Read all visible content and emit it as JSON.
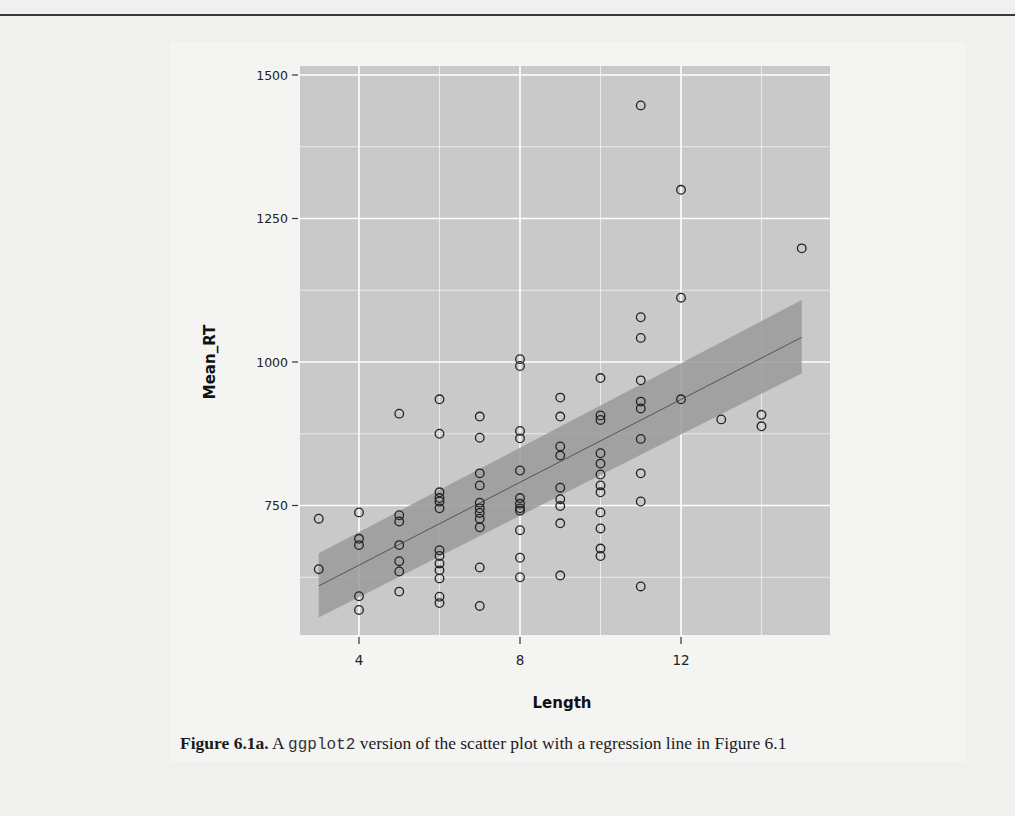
{
  "page": {
    "background": "#f0f0ef"
  },
  "caption": {
    "label": "Figure 6.1a.",
    "pre": " A ",
    "code": "ggplot2",
    "post": " version of the scatter plot with a regression line in Figure 6.1"
  },
  "chart_data": {
    "type": "scatter",
    "title": "",
    "xlabel": "Length",
    "ylabel": "Mean_RT",
    "xlim": [
      2.5,
      15.7
    ],
    "ylim": [
      570,
      1520
    ],
    "x_ticks": [
      4,
      8,
      12
    ],
    "y_ticks": [
      750,
      1000,
      1250,
      1500
    ],
    "x_minor_gridlines": [
      6,
      10,
      14
    ],
    "y_minor_gridlines": [
      625,
      875,
      1125,
      1375
    ],
    "grid": true,
    "legend": "none",
    "panel_color": "#c9c9c9",
    "grid_color": "#ffffff",
    "point_style": "open-circle",
    "regression": {
      "method": "lm",
      "x_range": [
        3,
        15
      ],
      "fit_y": [
        610,
        1043
      ],
      "ci_lower": [
        555,
        980
      ],
      "ci_upper": [
        667,
        1108
      ],
      "band_color": "#9a9a9a",
      "line_color": "#555555"
    },
    "points": [
      [
        3,
        727
      ],
      [
        3,
        639
      ],
      [
        4,
        738
      ],
      [
        4,
        692
      ],
      [
        4,
        681
      ],
      [
        4,
        592
      ],
      [
        4,
        568
      ],
      [
        5,
        910
      ],
      [
        5,
        733
      ],
      [
        5,
        722
      ],
      [
        5,
        681
      ],
      [
        5,
        653
      ],
      [
        5,
        635
      ],
      [
        5,
        600
      ],
      [
        6,
        935
      ],
      [
        6,
        875
      ],
      [
        6,
        773
      ],
      [
        6,
        763
      ],
      [
        6,
        757
      ],
      [
        6,
        745
      ],
      [
        6,
        672
      ],
      [
        6,
        662
      ],
      [
        6,
        649
      ],
      [
        6,
        637
      ],
      [
        6,
        623
      ],
      [
        6,
        591
      ],
      [
        6,
        580
      ],
      [
        7,
        905
      ],
      [
        7,
        868
      ],
      [
        7,
        806
      ],
      [
        7,
        785
      ],
      [
        7,
        755
      ],
      [
        7,
        745
      ],
      [
        7,
        737
      ],
      [
        7,
        727
      ],
      [
        7,
        712
      ],
      [
        7,
        642
      ],
      [
        7,
        575
      ],
      [
        8,
        1005
      ],
      [
        8,
        993
      ],
      [
        8,
        880
      ],
      [
        8,
        867
      ],
      [
        8,
        811
      ],
      [
        8,
        763
      ],
      [
        8,
        753
      ],
      [
        8,
        745
      ],
      [
        8,
        741
      ],
      [
        8,
        707
      ],
      [
        8,
        659
      ],
      [
        8,
        625
      ],
      [
        9,
        938
      ],
      [
        9,
        905
      ],
      [
        9,
        853
      ],
      [
        9,
        837
      ],
      [
        9,
        781
      ],
      [
        9,
        761
      ],
      [
        9,
        749
      ],
      [
        9,
        719
      ],
      [
        9,
        628
      ],
      [
        10,
        972
      ],
      [
        10,
        907
      ],
      [
        10,
        899
      ],
      [
        10,
        841
      ],
      [
        10,
        823
      ],
      [
        10,
        804
      ],
      [
        10,
        785
      ],
      [
        10,
        773
      ],
      [
        10,
        738
      ],
      [
        10,
        710
      ],
      [
        10,
        675
      ],
      [
        10,
        662
      ],
      [
        11,
        1447
      ],
      [
        11,
        1078
      ],
      [
        11,
        1042
      ],
      [
        11,
        968
      ],
      [
        11,
        931
      ],
      [
        11,
        919
      ],
      [
        11,
        866
      ],
      [
        11,
        806
      ],
      [
        11,
        757
      ],
      [
        11,
        609
      ],
      [
        12,
        1300
      ],
      [
        12,
        1112
      ],
      [
        12,
        935
      ],
      [
        13,
        900
      ],
      [
        14,
        908
      ],
      [
        14,
        888
      ],
      [
        15,
        1198
      ]
    ]
  }
}
